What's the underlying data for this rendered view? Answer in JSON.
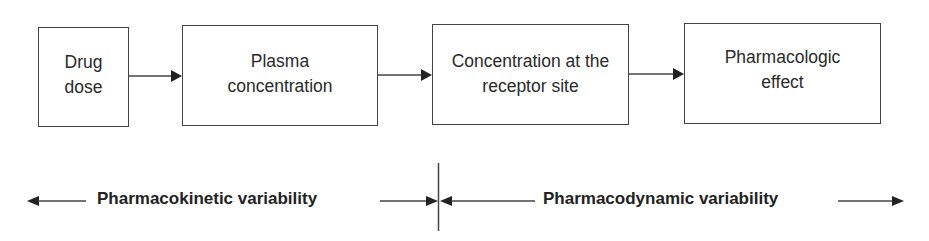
{
  "diagram": {
    "type": "flow",
    "boxes": [
      {
        "id": "drug-dose",
        "label": "Drug\ndose"
      },
      {
        "id": "plasma-concentration",
        "label": "Plasma\nconcentration"
      },
      {
        "id": "receptor-concentration",
        "label": "Concentration at the\nreceptor site"
      },
      {
        "id": "pharmacologic-effect",
        "label": "Pharmacologic\neffect"
      }
    ],
    "edges": [
      {
        "from": "drug-dose",
        "to": "plasma-concentration"
      },
      {
        "from": "plasma-concentration",
        "to": "receptor-concentration"
      },
      {
        "from": "receptor-concentration",
        "to": "pharmacologic-effect"
      }
    ],
    "ranges": [
      {
        "label": "Pharmacokinetic variability",
        "direction": "both"
      },
      {
        "label": "Pharmacodynamic variability",
        "direction": "both"
      }
    ],
    "colors": {
      "stroke": "#444444",
      "text": "#2a2a2a",
      "background": "#ffffff"
    }
  }
}
